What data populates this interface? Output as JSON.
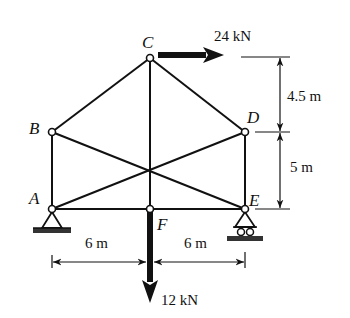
{
  "diagram": {
    "type": "truss",
    "nodes": [
      {
        "id": "A",
        "label": "A",
        "x": 52,
        "y": 209
      },
      {
        "id": "B",
        "label": "B",
        "x": 52,
        "y": 132
      },
      {
        "id": "C",
        "label": "C",
        "x": 150,
        "y": 58
      },
      {
        "id": "D",
        "label": "D",
        "x": 245,
        "y": 132
      },
      {
        "id": "E",
        "label": "E",
        "x": 245,
        "y": 209
      },
      {
        "id": "F",
        "label": "F",
        "x": 150,
        "y": 209
      }
    ],
    "members": [
      [
        "A",
        "B"
      ],
      [
        "B",
        "C"
      ],
      [
        "C",
        "D"
      ],
      [
        "D",
        "E"
      ],
      [
        "A",
        "F"
      ],
      [
        "F",
        "E"
      ],
      [
        "C",
        "F"
      ],
      [
        "A",
        "D"
      ],
      [
        "B",
        "E"
      ]
    ],
    "supports": [
      {
        "node": "A",
        "type": "pin"
      },
      {
        "node": "E",
        "type": "roller"
      }
    ],
    "loads": [
      {
        "node": "C",
        "label": "24 kN",
        "direction": "right"
      },
      {
        "node": "F",
        "label": "12 kN",
        "direction": "down"
      }
    ],
    "dimensions": {
      "horizontal": [
        {
          "label": "6 m",
          "from": "A",
          "to": "F"
        },
        {
          "label": "6 m",
          "from": "F",
          "to": "E"
        }
      ],
      "vertical": [
        {
          "label": "4.5 m",
          "from": "C",
          "to": "D"
        },
        {
          "label": "5 m",
          "from": "D",
          "to": "E"
        }
      ]
    }
  }
}
